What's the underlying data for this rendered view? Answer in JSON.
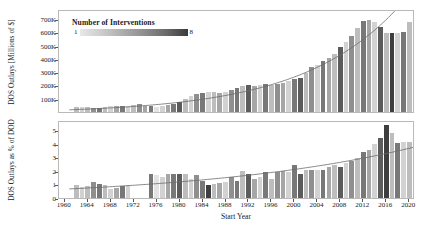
{
  "figure": {
    "xlabel": "Start Year",
    "legend": {
      "title": "Number of Interventions",
      "min_label": "1",
      "max_label": "8",
      "colormap_light": "#e8e8e8",
      "colormap_dark": "#3a3a3a"
    }
  },
  "chart_data": [
    {
      "type": "bar",
      "panel": "top",
      "title": "",
      "xlabel": "Start Year",
      "ylabel": "DOS Outlays [Millions of $]",
      "ylim": [
        0,
        760000
      ],
      "xlim": [
        1959,
        2021
      ],
      "yticks": [
        100000,
        200000,
        300000,
        400000,
        500000,
        600000,
        700000
      ],
      "ytick_labels": [
        "100K",
        "200K",
        "300K",
        "400K",
        "500K",
        "600K",
        "700K"
      ],
      "xticks": [
        1960,
        1964,
        1968,
        1972,
        1976,
        1980,
        1984,
        1988,
        1992,
        1996,
        2000,
        2004,
        2008,
        2012,
        2016,
        2020
      ],
      "grid": false,
      "legend_position": "upper-left-inside",
      "series": [
        {
          "name": "DOS Outlays",
          "x": [
            1962,
            1963,
            1964,
            1965,
            1966,
            1967,
            1968,
            1969,
            1970,
            1971,
            1972,
            1973,
            1974,
            1975,
            1976,
            1977,
            1978,
            1979,
            1980,
            1981,
            1982,
            1983,
            1984,
            1985,
            1986,
            1987,
            1988,
            1989,
            1990,
            1991,
            1992,
            1993,
            1994,
            1995,
            1996,
            1997,
            1998,
            1999,
            2000,
            2001,
            2002,
            2003,
            2004,
            2005,
            2006,
            2007,
            2008,
            2009,
            2010,
            2011,
            2012,
            2013,
            2014,
            2015,
            2016,
            2017,
            2018,
            2019,
            2020
          ],
          "values": [
            34000,
            36000,
            38000,
            33000,
            31000,
            41000,
            45000,
            47000,
            43000,
            49000,
            52000,
            57000,
            49000,
            44000,
            35000,
            42000,
            52000,
            62000,
            74000,
            100000,
            118000,
            132000,
            141000,
            151000,
            149000,
            143000,
            152000,
            162000,
            183000,
            198000,
            205000,
            196000,
            207000,
            213000,
            205000,
            210000,
            219000,
            231000,
            246000,
            259000,
            295000,
            338000,
            356000,
            381000,
            406000,
            438000,
            492000,
            528000,
            575000,
            634000,
            688000,
            691000,
            676000,
            641000,
            596000,
            593000,
            592000,
            602000,
            676000
          ],
          "colors_meta": "grayscale by number of interventions (1=light, 8=dark)",
          "interventions": [
            3,
            2,
            3,
            5,
            6,
            3,
            2,
            4,
            6,
            2,
            3,
            5,
            4,
            6,
            1,
            2,
            4,
            6,
            7,
            3,
            2,
            5,
            6,
            2,
            3,
            4,
            2,
            5,
            6,
            3,
            7,
            4,
            2,
            6,
            3,
            5,
            4,
            2,
            6,
            7,
            3,
            5,
            2,
            6,
            4,
            3,
            7,
            2,
            5,
            3,
            6,
            4,
            2,
            7,
            3,
            8,
            2,
            6,
            3
          ]
        }
      ],
      "annotations": [
        {
          "type": "trend-curve",
          "style": "exponential",
          "description": "smooth rising exponential fit curve"
        }
      ]
    },
    {
      "type": "bar",
      "panel": "bottom",
      "title": "",
      "xlabel": "Start Year",
      "ylabel": "DOS Outlays as % of DOD",
      "ylim": [
        0,
        5.6
      ],
      "xlim": [
        1959,
        2021
      ],
      "yticks": [
        0,
        1,
        2,
        3,
        4,
        5
      ],
      "ytick_labels": [
        "0",
        "1",
        "2",
        "3",
        "4",
        "5"
      ],
      "xticks": [
        1960,
        1964,
        1968,
        1972,
        1976,
        1980,
        1984,
        1988,
        1992,
        1996,
        2000,
        2004,
        2008,
        2012,
        2016,
        2020
      ],
      "grid": false,
      "series": [
        {
          "name": "DOS Outlays as % of DOD",
          "x": [
            1962,
            1963,
            1964,
            1965,
            1966,
            1967,
            1968,
            1969,
            1970,
            1971,
            1975,
            1976,
            1977,
            1978,
            1979,
            1980,
            1981,
            1982,
            1983,
            1984,
            1985,
            1986,
            1987,
            1988,
            1989,
            1990,
            1991,
            1992,
            1993,
            1994,
            1995,
            1996,
            1997,
            1998,
            1999,
            2000,
            2001,
            2002,
            2003,
            2004,
            2005,
            2006,
            2007,
            2008,
            2009,
            2010,
            2011,
            2012,
            2013,
            2014,
            2015,
            2016,
            2017,
            2018,
            2019,
            2020
          ],
          "values": [
            0.95,
            0.78,
            0.92,
            1.18,
            1.05,
            0.95,
            0.7,
            0.72,
            0.9,
            0.93,
            1.75,
            1.72,
            1.55,
            1.78,
            1.75,
            1.8,
            1.78,
            1.42,
            1.7,
            1.22,
            0.98,
            1.06,
            1.12,
            1.15,
            1.55,
            1.28,
            2.0,
            1.8,
            1.42,
            1.55,
            1.9,
            1.42,
            1.95,
            1.98,
            1.93,
            2.4,
            1.75,
            2.05,
            2.08,
            2.05,
            2.08,
            2.3,
            2.45,
            2.32,
            2.6,
            2.75,
            2.95,
            3.4,
            3.55,
            3.95,
            4.45,
            5.4,
            4.8,
            4.05,
            4.1,
            4.1
          ],
          "colors_meta": "grayscale by number of interventions (1=light, 8=dark)",
          "interventions": [
            3,
            2,
            3,
            5,
            6,
            3,
            2,
            4,
            6,
            2,
            6,
            1,
            2,
            4,
            6,
            7,
            3,
            2,
            5,
            6,
            8,
            3,
            4,
            2,
            5,
            6,
            3,
            7,
            4,
            2,
            6,
            3,
            5,
            4,
            2,
            6,
            7,
            3,
            5,
            2,
            6,
            4,
            3,
            7,
            2,
            5,
            3,
            6,
            4,
            2,
            7,
            8,
            3,
            6,
            2,
            3
          ]
        }
      ],
      "annotations": [
        {
          "type": "trend-curve",
          "style": "exponential",
          "description": "smooth rising trend line"
        }
      ]
    }
  ]
}
